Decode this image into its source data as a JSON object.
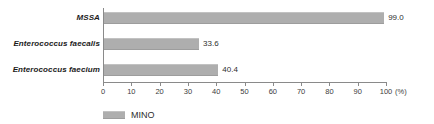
{
  "chart_data": {
    "type": "bar",
    "orientation": "horizontal",
    "title": "",
    "subtitle": "",
    "xlabel": "(%)",
    "ylabel": "",
    "categories": [
      "MSSA",
      "Enterococcus faecalis",
      "Enterococcus faecium"
    ],
    "values": [
      99.0,
      33.6,
      40.4
    ],
    "value_labels": [
      "99.0",
      "33.6",
      "40.4"
    ],
    "series": [
      {
        "name": "MINO",
        "values": [
          99.0,
          33.6,
          40.4
        ],
        "color": "#aeaeae"
      }
    ],
    "xlim": [
      0,
      100
    ],
    "xticks": [
      0,
      10,
      20,
      30,
      40,
      50,
      60,
      70,
      80,
      90,
      100
    ],
    "xtick_labels": [
      "0",
      "10",
      "20",
      "30",
      "40",
      "50",
      "60",
      "70",
      "80",
      "90",
      "100"
    ],
    "unit_label": "(%)",
    "grid": false,
    "legend": {
      "position": "bottom-left",
      "entries": [
        {
          "label": "MINO",
          "color": "#aeaeae"
        }
      ]
    },
    "colors": {
      "bar": "#aeaeae",
      "axis": "#8a8a8a",
      "text": "#2e2e2e",
      "background": "#ffffff"
    }
  }
}
